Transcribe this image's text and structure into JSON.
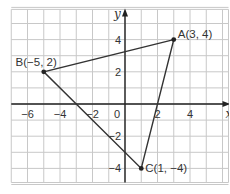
{
  "chart_data": {
    "type": "scatter",
    "title": "",
    "xlabel": "x",
    "ylabel": "y",
    "xlim": [
      -7,
      6
    ],
    "ylim": [
      -5,
      6
    ],
    "grid": true,
    "x_ticks": [
      {
        "value": -6,
        "label": "−6"
      },
      {
        "value": -4,
        "label": "−4"
      },
      {
        "value": -2,
        "label": "−2"
      },
      {
        "value": 0,
        "label": "0"
      },
      {
        "value": 2,
        "label": "2"
      },
      {
        "value": 4,
        "label": "4"
      }
    ],
    "y_ticks": [
      {
        "value": 4,
        "label": "4"
      },
      {
        "value": 2,
        "label": "2"
      },
      {
        "value": -2,
        "label": "−2"
      },
      {
        "value": -4,
        "label": "−4"
      }
    ],
    "points": [
      {
        "name": "A",
        "x": 3,
        "y": 4,
        "label": "A(3, 4)"
      },
      {
        "name": "B",
        "x": -5,
        "y": 2,
        "label": "B(−5, 2)"
      },
      {
        "name": "C",
        "x": 1,
        "y": -4,
        "label": "C(1, −4)"
      }
    ],
    "polygon": [
      "A",
      "B",
      "C"
    ],
    "colors": {
      "grid": "#c8c8c8",
      "axis": "#222222",
      "line": "#333333",
      "point": "#222222"
    }
  }
}
